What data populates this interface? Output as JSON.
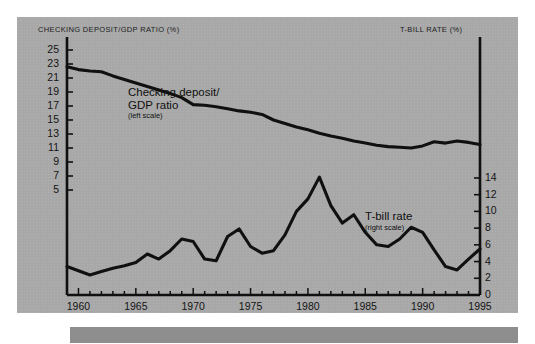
{
  "figure": {
    "background_color": "#a8a8a8",
    "line_color": "#101010",
    "axis_color": "#101010"
  },
  "labels": {
    "left_axis_title": "CHECKING DEPOSIT/GDP RATIO (%)",
    "right_axis_title": "T-BILL RATE (%)",
    "series1_name": "Checking deposit/",
    "series1_name2": "GDP ratio",
    "series1_scale": "(left scale)",
    "series2_name": "T-bill rate",
    "series2_scale": "(right scale)"
  },
  "chart_data": {
    "type": "line",
    "title": "",
    "xlabel": "",
    "ylabel": "CHECKING DEPOSIT/GDP RATIO (%)",
    "ylabel_right": "T-BILL RATE (%)",
    "grid": false,
    "legend": "inline-annotations",
    "xlim": [
      1959,
      1995
    ],
    "xticks": [
      1960,
      1965,
      1970,
      1975,
      1980,
      1985,
      1990,
      1995
    ],
    "xticklabels": [
      "1960",
      "1965",
      "1970",
      "1975",
      "1980",
      "1985",
      "1990",
      "1995"
    ],
    "xminor_step": 1,
    "ylim_left": [
      1,
      26
    ],
    "yticks_left": [
      25,
      23,
      21,
      19,
      17,
      15,
      13,
      11,
      9,
      7,
      5
    ],
    "yticklabels_left": [
      "25",
      "23",
      "21",
      "19",
      "17",
      "15",
      "13",
      "11",
      "9",
      "7",
      "5"
    ],
    "ylim_right": [
      0,
      15.5
    ],
    "yticks_right": [
      14,
      12,
      10,
      8,
      6,
      4,
      2,
      0
    ],
    "yticklabels_right": [
      "14",
      "12",
      "10",
      "8",
      "6",
      "4",
      "2",
      "0"
    ],
    "x": [
      1959,
      1960,
      1961,
      1962,
      1963,
      1964,
      1965,
      1966,
      1967,
      1968,
      1969,
      1970,
      1971,
      1972,
      1973,
      1974,
      1975,
      1976,
      1977,
      1978,
      1979,
      1980,
      1981,
      1982,
      1983,
      1984,
      1985,
      1986,
      1987,
      1988,
      1989,
      1990,
      1991,
      1992,
      1993,
      1994,
      1995
    ],
    "series": [
      {
        "name": "Checking deposit/GDP ratio",
        "axis": "left",
        "values": [
          22.6,
          22.2,
          22.0,
          21.9,
          21.3,
          20.8,
          20.3,
          19.8,
          19.3,
          18.8,
          18.2,
          17.2,
          17.1,
          16.9,
          16.6,
          16.3,
          16.1,
          15.8,
          15.0,
          14.5,
          14.0,
          13.6,
          13.1,
          12.7,
          12.4,
          12.0,
          11.7,
          11.4,
          11.2,
          11.1,
          11.0,
          11.3,
          11.9,
          11.7,
          12.0,
          11.8,
          11.5
        ]
      },
      {
        "name": "T-bill rate",
        "axis": "right",
        "values": [
          3.4,
          2.9,
          2.4,
          2.8,
          3.2,
          3.5,
          3.9,
          4.9,
          4.3,
          5.3,
          6.7,
          6.4,
          4.3,
          4.1,
          7.0,
          7.9,
          5.8,
          5.0,
          5.3,
          7.2,
          10.0,
          11.5,
          14.1,
          10.7,
          8.6,
          9.6,
          7.5,
          6.0,
          5.8,
          6.7,
          8.1,
          7.5,
          5.4,
          3.4,
          3.0,
          4.3,
          5.5
        ]
      }
    ]
  }
}
